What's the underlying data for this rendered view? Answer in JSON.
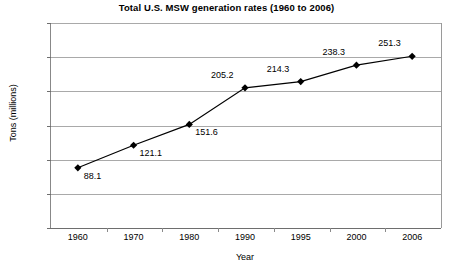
{
  "chart_data": {
    "type": "line",
    "title": "Total U.S. MSW generation rates (1960 to 2006)",
    "xlabel": "Year",
    "ylabel": "Tons (millions)",
    "categories": [
      "1960",
      "1970",
      "1980",
      "1990",
      "1995",
      "2000",
      "2006"
    ],
    "values": [
      88.1,
      121.1,
      151.6,
      205.2,
      214.3,
      238.3,
      251.3
    ],
    "point_labels": [
      "88.1",
      "121.1",
      "151.6",
      "205.2",
      "214.3",
      "238.3",
      "251.3"
    ],
    "ylim": [
      0,
      300
    ],
    "ytick_labels": [
      "0",
      "50",
      "100",
      "150",
      "200",
      "250",
      "300"
    ],
    "ytick_values": [
      0,
      50,
      100,
      150,
      200,
      250,
      300
    ],
    "grid": "horizontal",
    "legend": "none",
    "series": [
      {
        "name": "Total U.S. MSW generation",
        "values": [
          88.1,
          121.1,
          151.6,
          205.2,
          214.3,
          238.3,
          251.3
        ],
        "marker": "diamond",
        "marker_color": "#000000",
        "line_color": "#000000"
      }
    ],
    "colors": {
      "line": "#000000",
      "marker": "#000000",
      "gridline": "#a9a9a9",
      "axis": "#6e6e6e",
      "text": "#000000",
      "background": "#ffffff"
    }
  }
}
